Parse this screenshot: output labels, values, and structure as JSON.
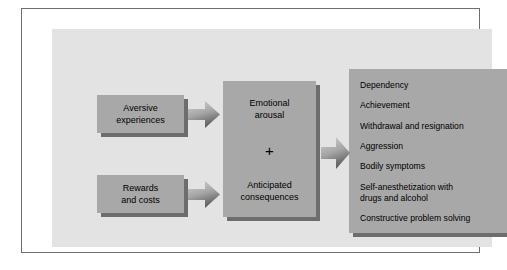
{
  "figure": {
    "type": "flow-diagram",
    "colors": {
      "panel_background": "#e3e3e3",
      "box_fill": "#a8a8a8",
      "box_shadow": "#6d6d6d",
      "frame_border": "#6e6e72",
      "text": "#000000",
      "arrow_light": "#c9c9c9",
      "arrow_dark": "#5f5f5f"
    }
  },
  "inputs": [
    {
      "id": "aversive",
      "lines": [
        "Aversive",
        "experiences"
      ]
    },
    {
      "id": "rewards",
      "lines": [
        "Rewards",
        "and costs"
      ]
    }
  ],
  "center": {
    "top_lines": [
      "Emotional",
      "arousal"
    ],
    "operator": "+",
    "bottom_lines": [
      "Anticipated",
      "consequences"
    ]
  },
  "outcomes": {
    "items": [
      "Dependency",
      "Achievement",
      "Withdrawal and resignation",
      "Aggression",
      "Bodily symptoms",
      "Self-anesthetization with\ndrugs and alcohol",
      "Constructive problem solving"
    ]
  },
  "arrows": [
    {
      "id": "arrow-aversive",
      "from": "aversive",
      "to": "center",
      "direction": "right"
    },
    {
      "id": "arrow-rewards",
      "from": "rewards",
      "to": "center",
      "direction": "right"
    },
    {
      "id": "arrow-center",
      "from": "center",
      "to": "outcomes",
      "direction": "right"
    }
  ]
}
